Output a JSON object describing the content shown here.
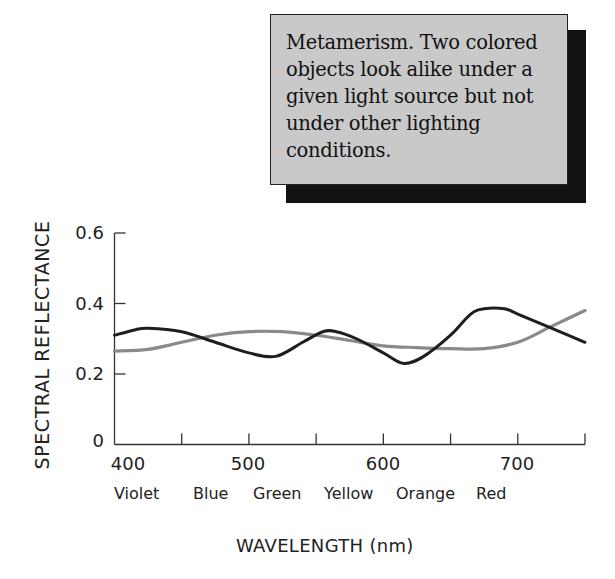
{
  "caption": {
    "lines": [
      "Metamerism. Two colored",
      "objects look alike under a",
      "given light source but not",
      "under other lighting",
      "conditions."
    ]
  },
  "axes": {
    "ylabel": "SPECTRAL REFLECTANCE",
    "xlabel": "WAVELENGTH (nm)",
    "yticks": [
      "0.6",
      "0.4",
      "0.2",
      "0"
    ],
    "xticks": [
      "400",
      "500",
      "600",
      "700"
    ],
    "color_bands": [
      "Violet",
      "Blue",
      "Green",
      "Yellow",
      "Orange",
      "Red"
    ]
  },
  "colors": {
    "series_dark": "#1e1e1e",
    "series_gray": "#8a8a8a",
    "caption_bg": "#c9c9c9",
    "caption_shadow": "#111111"
  },
  "chart_data": {
    "type": "line",
    "title": "Metamerism. Two colored objects look alike under a given light source but not under other lighting conditions.",
    "xlabel": "WAVELENGTH (nm)",
    "ylabel": "SPECTRAL REFLECTANCE",
    "xlim": [
      400,
      750
    ],
    "ylim": [
      0,
      0.6
    ],
    "xticks": [
      400,
      500,
      600,
      700
    ],
    "xticks_minor": [
      450,
      550,
      650,
      750
    ],
    "yticks": [
      0,
      0.2,
      0.4,
      0.6
    ],
    "x_category_labels": [
      "Violet",
      "Blue",
      "Green",
      "Yellow",
      "Orange",
      "Red"
    ],
    "grid": false,
    "legend": "none",
    "series": [
      {
        "name": "Object A (dark curve)",
        "color": "#1e1e1e",
        "x": [
          400,
          415,
          425,
          450,
          475,
          500,
          520,
          540,
          555,
          565,
          580,
          600,
          615,
          630,
          650,
          665,
          675,
          690,
          700,
          725,
          750
        ],
        "values": [
          0.31,
          0.325,
          0.33,
          0.32,
          0.29,
          0.26,
          0.25,
          0.29,
          0.32,
          0.32,
          0.3,
          0.26,
          0.23,
          0.25,
          0.31,
          0.37,
          0.385,
          0.385,
          0.37,
          0.33,
          0.29
        ]
      },
      {
        "name": "Object B (gray curve)",
        "color": "#8a8a8a",
        "x": [
          400,
          425,
          450,
          475,
          500,
          525,
          550,
          575,
          600,
          625,
          650,
          675,
          700,
          725,
          750
        ],
        "values": [
          0.265,
          0.27,
          0.29,
          0.31,
          0.32,
          0.32,
          0.31,
          0.295,
          0.28,
          0.275,
          0.272,
          0.272,
          0.29,
          0.335,
          0.38
        ]
      }
    ]
  }
}
